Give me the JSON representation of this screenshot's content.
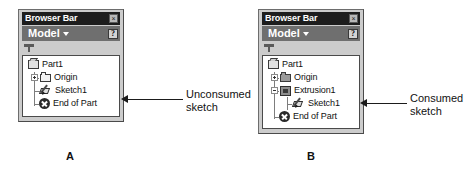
{
  "figure": {
    "panels": [
      {
        "id": "A",
        "letter": "A",
        "titlebar": {
          "title": "Browser Bar",
          "close_label": "×",
          "close_icon": "close-icon"
        },
        "modelbar": {
          "label": "Model",
          "caret_icon": "chevron-down-icon",
          "help_label": "?",
          "help_icon": "help-icon"
        },
        "filter": {
          "icon": "filter-funnel-icon"
        },
        "tree": [
          {
            "label": "Part1",
            "icon": "part-icon",
            "depth": 0,
            "expander": "none"
          },
          {
            "label": "Origin",
            "icon": "folder-icon",
            "depth": 1,
            "expander": "plus"
          },
          {
            "label": "Sketch1",
            "icon": "sketch-icon",
            "depth": 1,
            "expander": "none"
          },
          {
            "label": "End of Part",
            "icon": "end-of-part-icon",
            "depth": 1,
            "expander": "none"
          }
        ],
        "callout": {
          "line1": "Unconsumed",
          "line2": "sketch",
          "target": "Sketch1"
        }
      },
      {
        "id": "B",
        "letter": "B",
        "titlebar": {
          "title": "Browser Bar",
          "close_label": "×",
          "close_icon": "close-icon"
        },
        "modelbar": {
          "label": "Model",
          "caret_icon": "chevron-down-icon",
          "help_label": "?",
          "help_icon": "help-icon"
        },
        "filter": {
          "icon": "filter-funnel-icon"
        },
        "tree": [
          {
            "label": "Part1",
            "icon": "part-icon",
            "depth": 0,
            "expander": "none"
          },
          {
            "label": "Origin",
            "icon": "folder-icon",
            "depth": 1,
            "expander": "plus"
          },
          {
            "label": "Extrusion1",
            "icon": "extrusion-icon",
            "depth": 1,
            "expander": "minus"
          },
          {
            "label": "Sketch1",
            "icon": "sketch-icon",
            "depth": 2,
            "expander": "none"
          },
          {
            "label": "End of Part",
            "icon": "end-of-part-icon",
            "depth": 1,
            "expander": "none"
          }
        ],
        "callout": {
          "line1": "Consumed",
          "line2": "sketch",
          "target": "Sketch1"
        }
      }
    ]
  },
  "colors": {
    "panel_bg": "#cccccc",
    "titlebar_bg": "#1d1d1d",
    "titlebar_text": "#ffffff",
    "modelbar_bg": "#6f6f6f",
    "tree_bg": "#ffffff",
    "text": "#111111",
    "leader": "#1b1b1b"
  }
}
